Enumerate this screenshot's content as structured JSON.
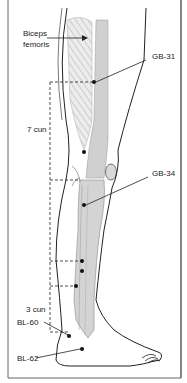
{
  "figure": {
    "labels": {
      "muscle": "Biceps\nfemoris",
      "muscle_line1": "Biceps",
      "muscle_line2": "femoris",
      "gb31": "GB-31",
      "gb34": "GB-34",
      "seven_cun": "7 cun",
      "three_cun": "3 cun",
      "bl60": "BL-60",
      "bl62": "BL-62"
    },
    "points": [
      {
        "name": "GB-31",
        "x": 94,
        "y": 82
      },
      {
        "name": "knee-point",
        "x": 84,
        "y": 152
      },
      {
        "name": "GB-34",
        "x": 84,
        "y": 205
      },
      {
        "name": "point-a",
        "x": 82,
        "y": 261
      },
      {
        "name": "point-b",
        "x": 82,
        "y": 271
      },
      {
        "name": "point-c",
        "x": 76,
        "y": 286
      },
      {
        "name": "BL-60",
        "x": 69,
        "y": 336
      },
      {
        "name": "BL-62",
        "x": 82,
        "y": 349
      }
    ],
    "colors": {
      "line": "#222222",
      "band_gray": "#cfcfcf",
      "muscle_fill": "#e6e6e6",
      "frame": "#555555"
    }
  }
}
